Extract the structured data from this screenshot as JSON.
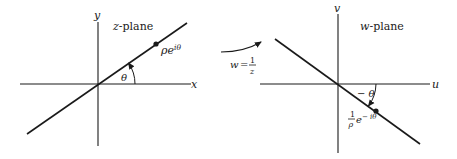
{
  "diagram": {
    "left_panel": {
      "plane_label_var": "z",
      "plane_label_suffix": "-plane",
      "x_axis_label": "x",
      "y_axis_label": "y",
      "angle_label": "θ",
      "point_label_base": "ρe",
      "point_label_exp": "iθ"
    },
    "mapping": {
      "lhs": "w",
      "eq": "=",
      "numerator": "1",
      "denominator": "z"
    },
    "right_panel": {
      "plane_label_var": "w",
      "plane_label_suffix": "-plane",
      "x_axis_label": "u",
      "y_axis_label": "v",
      "angle_label": "− θ",
      "point_label_frac_num": "1",
      "point_label_frac_den": "ρ",
      "point_label_base": "e",
      "point_label_exp": "− iθ"
    },
    "colors": {
      "ink": "#1a1a1a",
      "background": "#ffffff"
    }
  }
}
